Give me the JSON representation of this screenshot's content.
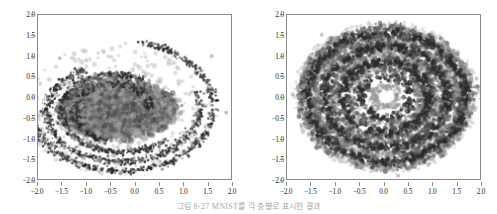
{
  "figure": {
    "caption": "그림 8-27   MNIST를 각 층별로 표시한 결과",
    "panel_count": 2
  },
  "chart_data": [
    {
      "type": "scatter",
      "title": "",
      "panel_index": 0,
      "panel_name": "left-scatter-plot",
      "xlabel": "",
      "ylabel": "",
      "xlim": [
        -2.0,
        2.0
      ],
      "ylim": [
        -2.0,
        2.0
      ],
      "xticks": [
        "-2.0",
        "-1.5",
        "-1.0",
        "-0.5",
        "0.0",
        "0.5",
        "1.0",
        "1.5",
        "2.0"
      ],
      "yticks": [
        "2.0",
        "1.5",
        "1.0",
        "0.5",
        "0.0",
        "-0.5",
        "-1.0",
        "-1.5",
        "-2.0"
      ],
      "xtick_values": [
        -2.0,
        -1.5,
        -1.0,
        -0.5,
        0.0,
        0.5,
        1.0,
        1.5,
        2.0
      ],
      "ytick_values": [
        2.0,
        1.5,
        1.0,
        0.5,
        0.0,
        -0.5,
        -1.0,
        -1.5,
        -2.0
      ],
      "grid": false,
      "legend": false,
      "legend_position": "none",
      "point_color": "#3a3a3a",
      "point_color_light": "#a8a8a8",
      "point_count": 6000,
      "description": "Dense spiral/arc structure with dark thin arms in upper region and a heavy blurred cluster centered near (-0.5, -0.4)",
      "structure": "spiral-arcs-with-dense-core",
      "arms": 4,
      "center": [
        -0.35,
        -0.3
      ],
      "core_radius": 0.95,
      "outer_radius": 1.75,
      "outliers": [
        [
          -1.9,
          -0.45
        ],
        [
          -1.7,
          -1.15
        ],
        [
          -1.45,
          -1.25
        ],
        [
          -1.05,
          -1.5
        ],
        [
          1.9,
          -0.38
        ],
        [
          1.6,
          1.0
        ],
        [
          -1.55,
          0.95
        ]
      ]
    },
    {
      "type": "scatter",
      "title": "",
      "panel_index": 1,
      "panel_name": "right-scatter-plot",
      "xlabel": "",
      "ylabel": "",
      "xlim": [
        -2.0,
        2.0
      ],
      "ylim": [
        -2.0,
        2.0
      ],
      "xticks": [
        "-2.0",
        "-1.5",
        "-1.0",
        "-0.5",
        "0.0",
        "0.5",
        "1.0",
        "1.5",
        "2.0"
      ],
      "yticks": [
        "2.0",
        "1.5",
        "1.0",
        "0.5",
        "0.0",
        "-0.5",
        "-1.0",
        "-1.5",
        "-2.0"
      ],
      "xtick_values": [
        -2.0,
        -1.5,
        -1.0,
        -0.5,
        0.0,
        0.5,
        1.0,
        1.5,
        2.0
      ],
      "ytick_values": [
        2.0,
        1.5,
        1.0,
        0.5,
        0.0,
        -0.5,
        -1.0,
        -1.5,
        -2.0
      ],
      "grid": false,
      "legend": false,
      "legend_position": "none",
      "point_color": "#3a3a3a",
      "point_color_light": "#a8a8a8",
      "point_count": 6000,
      "description": "Dense concentric ring / annulus cloud filling a disk, with an empty white hole at the center near (0.05, 0.0)",
      "structure": "concentric-rings-with-hollow-center",
      "rings": 4,
      "center": [
        0.05,
        0.0
      ],
      "hole_radius": 0.32,
      "outer_radius": 1.8,
      "outliers": [
        [
          -1.62,
          -0.55
        ],
        [
          1.58,
          0.8
        ],
        [
          0.3,
          -1.92
        ],
        [
          -1.7,
          0.0
        ],
        [
          -1.28,
          1.52
        ]
      ]
    }
  ]
}
